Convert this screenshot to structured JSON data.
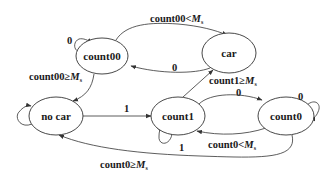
{
  "diagram": {
    "type": "state-machine",
    "states": [
      {
        "id": "count00",
        "label": "count00"
      },
      {
        "id": "car",
        "label": "car"
      },
      {
        "id": "no_car",
        "label": "no car"
      },
      {
        "id": "count1",
        "label": "count1"
      },
      {
        "id": "count0",
        "label": "count0"
      }
    ],
    "transitions": [
      {
        "from": "count00",
        "to": "count00",
        "label": "0"
      },
      {
        "from": "count00",
        "to": "car",
        "label_main": "count00<",
        "label_var": "M",
        "label_sub": "s"
      },
      {
        "from": "car",
        "to": "count00",
        "label": "0"
      },
      {
        "from": "count00",
        "to": "no_car",
        "label_main": "count00≥",
        "label_var": "M",
        "label_sub": "s"
      },
      {
        "from": "no_car",
        "to": "no_car",
        "label": ""
      },
      {
        "from": "no_car",
        "to": "count1",
        "label": "1"
      },
      {
        "from": "count1",
        "to": "car",
        "label_main": "count1≥",
        "label_var": "M",
        "label_sub": "s"
      },
      {
        "from": "count1",
        "to": "count0",
        "label": "0"
      },
      {
        "from": "count0",
        "to": "count0",
        "label": "0"
      },
      {
        "from": "count0",
        "to": "count1",
        "label_main": "count0<",
        "label_var": "M",
        "label_sub": "s"
      },
      {
        "from": "count1",
        "to": "count1",
        "label": "1"
      },
      {
        "from": "count0",
        "to": "no_car",
        "label_main": "count0≥",
        "label_var": "M",
        "label_sub": "s"
      }
    ]
  }
}
